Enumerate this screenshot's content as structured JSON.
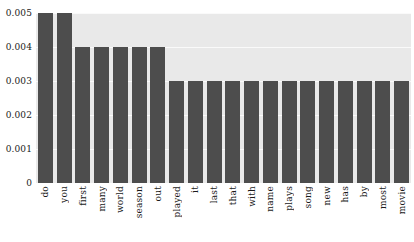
{
  "chart_data": {
    "type": "bar",
    "title": "",
    "xlabel": "",
    "ylabel": "",
    "categories": [
      "do",
      "you",
      "first",
      "many",
      "world",
      "season",
      "out",
      "played",
      "it",
      "last",
      "that",
      "with",
      "name",
      "plays",
      "song",
      "new",
      "has",
      "by",
      "most",
      "movie"
    ],
    "values": [
      0.005,
      0.005,
      0.004,
      0.004,
      0.004,
      0.004,
      0.004,
      0.003,
      0.003,
      0.003,
      0.003,
      0.003,
      0.003,
      0.003,
      0.003,
      0.003,
      0.003,
      0.003,
      0.003,
      0.003
    ],
    "ylim": [
      0,
      0.005
    ],
    "yticks": [
      0,
      0.001,
      0.002,
      0.003,
      0.004,
      0.005
    ],
    "ytick_labels": [
      "0",
      "0.001",
      "0.002",
      "0.003",
      "0.004",
      "0.005"
    ],
    "grid": true,
    "legend": null,
    "bar_color": "#4d4d4d",
    "plot_background": "#e9e9e9",
    "gridline_color": "#fafafa",
    "figure_background": "#ffffff"
  }
}
